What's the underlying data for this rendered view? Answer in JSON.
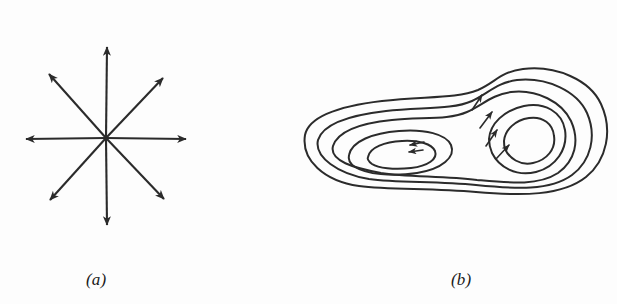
{
  "figure": {
    "width": 617,
    "height": 304,
    "background_color": "#fdfdfd",
    "ink_color": "#2b2b2b"
  },
  "panels": [
    {
      "id": "a",
      "caption": "(a)",
      "type": "radial-arrow-star",
      "description": "Eight arrows radiating outward from a single common center point, evenly spaced at 45 degree intervals",
      "center": {
        "x": 106,
        "y": 138
      },
      "arrow_count": 8,
      "arm_length_axial": 82,
      "arm_length_diagonal": 59,
      "arrows": [
        {
          "name": "arrow-east",
          "angle_deg": 0,
          "tip": {
            "x": 188,
            "y": 139
          }
        },
        {
          "name": "arrow-northeast",
          "angle_deg": 45,
          "tip": {
            "x": 165,
            "y": 76
          }
        },
        {
          "name": "arrow-north",
          "angle_deg": 90,
          "tip": {
            "x": 107,
            "y": 44
          }
        },
        {
          "name": "arrow-northwest",
          "angle_deg": 135,
          "tip": {
            "x": 47,
            "y": 72
          }
        },
        {
          "name": "arrow-west",
          "angle_deg": 180,
          "tip": {
            "x": 24,
            "y": 139
          }
        },
        {
          "name": "arrow-southwest",
          "angle_deg": 225,
          "tip": {
            "x": 48,
            "y": 202
          }
        },
        {
          "name": "arrow-south",
          "angle_deg": 270,
          "tip": {
            "x": 107,
            "y": 228
          }
        },
        {
          "name": "arrow-southeast",
          "angle_deg": 315,
          "tip": {
            "x": 166,
            "y": 201
          }
        }
      ]
    },
    {
      "id": "b",
      "caption": "(b)",
      "type": "contour-map",
      "description": "Nested closed contour lines forming a peanut shaped region with two basins; arrowheads on the contours point inward toward each basin center",
      "bounds": {
        "x_min": 305,
        "x_max": 607,
        "y_min": 68,
        "y_max": 193
      },
      "basins": [
        {
          "name": "left-basin",
          "center": {
            "x": 407,
            "y": 151
          },
          "contour_count": 4,
          "arrowhead_count": 2,
          "arrow_direction": "inward-left"
        },
        {
          "name": "right-basin",
          "center": {
            "x": 521,
            "y": 140
          },
          "contour_count": 4,
          "arrowhead_count": 4,
          "arrow_direction": "inward-upper-right"
        }
      ]
    }
  ]
}
